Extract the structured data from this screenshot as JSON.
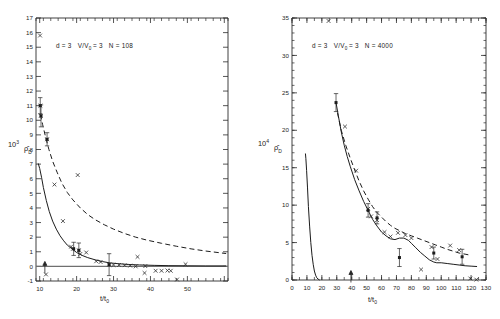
{
  "figure": {
    "title": "",
    "panel_count": 2
  },
  "chart_data": [
    {
      "type": "scatter",
      "panel": "left",
      "title": "",
      "annotation": "d = 3   V/V₀ = 3   N = 108",
      "annotation_parts": {
        "d": "d = 3",
        "volume_ratio": "V/V",
        "volume_ratio_sub": "0",
        "volume_ratio_value": "= 3",
        "n_label": "N = 108"
      },
      "xlabel": "t/t",
      "xlabel_sub": "0",
      "ylabel": "10",
      "ylabel_sup": "3",
      "ylabel_rho": "ρ̂",
      "ylabel_sub": "D",
      "xlim": [
        9,
        61
      ],
      "ylim": [
        -1,
        17
      ],
      "xticks": [
        10,
        20,
        30,
        40,
        50,
        60
      ],
      "xticklabels": [
        "10",
        "20",
        "30",
        "40",
        "50",
        ""
      ],
      "xtick_minor_step": 2,
      "yticks": [
        -1,
        0,
        1,
        2,
        3,
        4,
        5,
        6,
        7,
        8,
        9,
        10,
        11,
        12,
        13,
        14,
        15,
        16,
        17
      ],
      "yticklabels": [
        "-1",
        "0",
        "1",
        "2",
        "3",
        "4",
        "5",
        "6",
        "7",
        "8",
        "9",
        "10",
        "11",
        "12",
        "13",
        "14",
        "15",
        "16",
        "17"
      ],
      "grid": false,
      "legend": "none",
      "zero_line": 0,
      "series": [
        {
          "name": "solid-curve",
          "style": "solid",
          "x": [
            9.6,
            10.0,
            10.5,
            11.0,
            11.8,
            12.6,
            13.5,
            14.5,
            15.5,
            16.5,
            17.5,
            18.5,
            20.0,
            21.5,
            23.0,
            25.0,
            27.0,
            29.0,
            31.0,
            34.0,
            37.0,
            41.0,
            45.0,
            50.0,
            55.0,
            60.5
          ],
          "y": [
            7.05,
            6.7,
            6.1,
            5.4,
            4.5,
            3.75,
            3.1,
            2.55,
            2.1,
            1.75,
            1.45,
            1.25,
            0.95,
            0.75,
            0.6,
            0.45,
            0.33,
            0.24,
            0.19,
            0.13,
            0.1,
            0.07,
            0.05,
            0.04,
            0.03,
            0.03
          ]
        },
        {
          "name": "dashed-curve",
          "style": "dashed",
          "x": [
            10.2,
            10.8,
            11.6,
            12.5,
            13.5,
            14.7,
            16.0,
            17.5,
            19.0,
            21.0,
            23.0,
            25.0,
            27.5,
            30.0,
            33.0,
            36.0,
            39.0,
            43.0,
            47.0,
            51.0,
            55.0,
            60.5
          ],
          "y": [
            10.4,
            9.7,
            8.85,
            8.0,
            7.2,
            6.45,
            5.7,
            5.05,
            4.55,
            4.0,
            3.55,
            3.2,
            2.85,
            2.55,
            2.25,
            2.0,
            1.8,
            1.58,
            1.38,
            1.2,
            1.05,
            0.88
          ]
        },
        {
          "name": "scatter-x-points",
          "style": "cross",
          "x": [
            10.1,
            10.2,
            10.3,
            12.0,
            14.0,
            16.3,
            18.5,
            19.0,
            20.3,
            20.6,
            21.0,
            22.6,
            25.3,
            26.5,
            28.8,
            30.0,
            31.5,
            33.0,
            34.5,
            36.0,
            36.5,
            38.4,
            38.6,
            41.4,
            43.0,
            44.6,
            45.5,
            47.2,
            49.5,
            11.7
          ],
          "y": [
            15.8,
            11.0,
            10.3,
            8.7,
            5.6,
            3.1,
            1.35,
            1.2,
            6.25,
            1.1,
            0.85,
            0.95,
            0.35,
            0.3,
            0.12,
            0.1,
            0.1,
            0.08,
            0.05,
            0.0,
            0.65,
            -0.45,
            0.02,
            -0.3,
            -0.3,
            -0.28,
            -0.3,
            -0.9,
            0.15,
            -0.55
          ]
        },
        {
          "name": "error-bar-points",
          "style": "square-errorbar",
          "x": [
            10.15,
            10.35,
            12.0,
            19.2,
            20.6,
            28.8
          ],
          "y": [
            11.0,
            10.3,
            8.7,
            1.2,
            1.1,
            0.12
          ],
          "yerr": [
            0.55,
            0.75,
            0.45,
            0.45,
            0.5,
            0.75
          ]
        }
      ],
      "arrow_marker": {
        "x": 11.4,
        "y": 0.0,
        "direction": "up"
      }
    },
    {
      "type": "scatter",
      "panel": "right",
      "title": "",
      "annotation": "d = 3   V/V₀ = 3   N = 4000",
      "annotation_parts": {
        "d": "d = 3",
        "volume_ratio": "V/V",
        "volume_ratio_sub": "0",
        "volume_ratio_value": "= 3",
        "n_label": "N = 4000"
      },
      "xlabel": "t/t",
      "xlabel_sub": "0",
      "ylabel": "10",
      "ylabel_sup": "4",
      "ylabel_rho": "ρ̂",
      "ylabel_sub": "D",
      "xlim": [
        0,
        130
      ],
      "ylim": [
        0,
        35
      ],
      "xticks": [
        0,
        10,
        20,
        30,
        40,
        50,
        60,
        70,
        80,
        90,
        100,
        110,
        120,
        130
      ],
      "xticklabels": [
        "0",
        "10",
        "20",
        "30",
        "40",
        "50",
        "60",
        "70",
        "80",
        "90",
        "100",
        "110",
        "120",
        "130"
      ],
      "xtick_minor_step": 5,
      "yticks": [
        0,
        5,
        10,
        15,
        20,
        25,
        30,
        35
      ],
      "yticklabels": [
        "0",
        "5",
        "10",
        "15",
        "20",
        "25",
        "30",
        "35"
      ],
      "grid": false,
      "legend": "none",
      "series": [
        {
          "name": "solid-curve-early",
          "style": "solid",
          "x": [
            9.0,
            9.3,
            9.8,
            10.4,
            11.0,
            11.8,
            12.6,
            13.4,
            14.2,
            15.0,
            15.8,
            16.6,
            17.5,
            18.5
          ],
          "y": [
            16.9,
            16.2,
            14.6,
            12.3,
            9.8,
            7.2,
            5.0,
            3.3,
            2.1,
            1.2,
            0.65,
            0.3,
            0.12,
            0.0
          ]
        },
        {
          "name": "solid-curve-main",
          "style": "solid",
          "x": [
            29.5,
            31,
            33,
            35,
            37,
            39,
            42,
            45,
            48,
            51,
            54,
            57,
            60,
            63,
            66,
            69,
            72,
            75,
            78,
            80,
            83,
            86,
            89,
            92,
            95,
            97,
            100,
            104,
            108,
            112,
            116,
            120,
            124
          ],
          "y": [
            23.7,
            22.0,
            19.8,
            18.0,
            16.5,
            15.2,
            13.4,
            11.9,
            10.5,
            9.3,
            8.1,
            7.2,
            6.4,
            5.9,
            5.5,
            5.4,
            5.6,
            5.6,
            5.3,
            4.9,
            4.3,
            3.7,
            3.2,
            2.7,
            2.4,
            2.3,
            2.3,
            2.2,
            2.1,
            2.0,
            1.9,
            1.85,
            1.8
          ]
        },
        {
          "name": "dashed-curve",
          "style": "dashed",
          "x": [
            30.5,
            33,
            36,
            39,
            42,
            45,
            48,
            51,
            54,
            57,
            60,
            63,
            66,
            69,
            72,
            76,
            80,
            84,
            88,
            92,
            96,
            100,
            104,
            108,
            112,
            116,
            120
          ],
          "y": [
            22.3,
            20.0,
            18.0,
            16.3,
            14.7,
            13.2,
            11.9,
            10.8,
            9.8,
            9.0,
            8.4,
            7.8,
            7.3,
            6.9,
            6.6,
            6.2,
            5.9,
            5.6,
            5.3,
            5.0,
            4.7,
            4.4,
            4.1,
            3.85,
            3.6,
            3.45,
            3.3
          ]
        },
        {
          "name": "scatter-x-points",
          "style": "cross",
          "x": [
            24.5,
            35.5,
            43.0,
            51.0,
            53.0,
            57.0,
            62.0,
            66.0,
            71.0,
            76.0,
            80.0,
            86.5,
            93.5,
            97.5,
            106.0,
            112.0,
            119.5,
            123.5
          ],
          "y": [
            34.6,
            20.5,
            14.6,
            9.5,
            8.5,
            8.0,
            6.4,
            5.8,
            6.3,
            6.0,
            5.6,
            1.4,
            4.4,
            2.8,
            4.6,
            4.0,
            0.2,
            0.05
          ]
        },
        {
          "name": "error-bar-points",
          "style": "square-errorbar",
          "x": [
            29.5,
            51.0,
            57.0,
            72.0,
            95.0,
            114.0
          ],
          "y": [
            23.7,
            9.3,
            8.3,
            3.0,
            3.6,
            3.1
          ],
          "yerr": [
            1.2,
            0.9,
            0.8,
            1.2,
            0.8,
            1.0
          ]
        }
      ],
      "arrow_marker": {
        "x": 39.5,
        "y": 0.6,
        "direction": "up"
      }
    }
  ]
}
